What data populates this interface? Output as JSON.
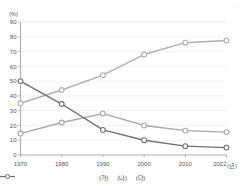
{
  "axis": {
    "unit_label": "(%)",
    "x_unit": "(년)",
    "y_ticks": [
      "90",
      "80",
      "70",
      "60",
      "50",
      "40",
      "30",
      "20",
      "10",
      "0"
    ],
    "x_ticks": [
      "1970",
      "1980",
      "1990",
      "2000",
      "2010",
      "2022"
    ]
  },
  "legend": {
    "items": [
      {
        "label": "(가)",
        "color": "#b0b0b0"
      },
      {
        "label": "(나)",
        "color": "#a8a8a8"
      },
      {
        "label": "(다)",
        "color": "#707070"
      }
    ]
  },
  "corner": {
    "mark": "⌐"
  },
  "chart_data": {
    "type": "line",
    "title": "",
    "xlabel": "(년)",
    "ylabel": "(%)",
    "ylim": [
      0,
      90
    ],
    "grid": true,
    "legend_position": "bottom",
    "categories": [
      "1970",
      "1980",
      "1990",
      "2000",
      "2010",
      "2022"
    ],
    "series": [
      {
        "name": "(가)",
        "color": "#b0b0b0",
        "values": [
          35.0,
          44.0,
          54.0,
          68.0,
          76.0,
          77.5
        ]
      },
      {
        "name": "(나)",
        "color": "#a8a8a8",
        "values": [
          14.5,
          22.0,
          28.0,
          20.0,
          16.5,
          15.5
        ]
      },
      {
        "name": "(다)",
        "color": "#707070",
        "values": [
          50.0,
          34.5,
          17.0,
          10.0,
          6.0,
          5.0
        ]
      }
    ]
  }
}
